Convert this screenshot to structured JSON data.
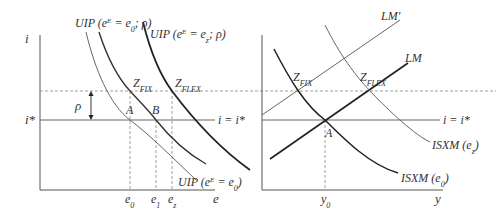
{
  "left_panel": {
    "y_axis_label": "i",
    "x_axis_label": "e",
    "istar_label": "i*",
    "rho_label": "ρ",
    "iline_label": "i = i*",
    "curves": {
      "uip_e0_rho": "UIP (e",
      "uip_e0_rho_sup": "E",
      "uip_e0_rho_rest": " = e",
      "uip_e0_rho_sub": "0",
      "uip_e0_rho_end": "; ρ)",
      "uip_ez_rho": "UIP (e",
      "uip_ez_rho_sup": "E",
      "uip_ez_rho_rest": " = e",
      "uip_ez_rho_sub": "z",
      "uip_ez_rho_end": "; ρ)",
      "uip_e0": "UIP (e",
      "uip_e0_sup": "E",
      "uip_e0_rest": " = e",
      "uip_e0_sub": "0",
      "uip_e0_end": ")"
    },
    "points": {
      "A": "A",
      "B": "B",
      "zfix": "Z",
      "zfix_sub": "FIX",
      "zflex": "Z",
      "zflex_sub": "FLEX"
    },
    "ticks": {
      "e0": "e",
      "e0_sub": "0",
      "e1": "e",
      "e1_sub": "1",
      "ez": "e",
      "ez_sub": "z"
    }
  },
  "right_panel": {
    "x_axis_label": "y",
    "iline_label": "i = i*",
    "curves": {
      "lm_prime": "LM′",
      "lm": "LM",
      "isxm_ez": "ISXM (e",
      "isxm_ez_sub": "z",
      "isxm_ez_end": ")",
      "isxm_e0": "ISXM (e",
      "isxm_e0_sub": "0",
      "isxm_e0_end": ")"
    },
    "points": {
      "A": "A",
      "zfix": "Z",
      "zfix_sub": "FIX",
      "zflex": "Z",
      "zflex_sub": "FLEX"
    },
    "ticks": {
      "y0": "y",
      "y0_sub": "0"
    }
  },
  "colors": {
    "axis": "#555555",
    "curve_thin": "#666666",
    "curve_thick": "#222222",
    "dashed": "#888888"
  }
}
